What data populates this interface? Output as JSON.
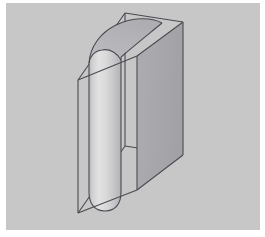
{
  "figure": {
    "canvas": {
      "width": 265,
      "height": 237
    },
    "colors": {
      "page_background": "#ffffff",
      "plot_background": "#c8c8c8",
      "edge_line": "#4a4a52",
      "box_right_face": "#a8a8ac",
      "box_front_face": "#c2c2c4",
      "cylinder_light": "#dcdcdc",
      "cylinder_mid": "#c9c9cb",
      "cylinder_dark": "#b4b4b8",
      "cylinder_top_cut": "#b9b9bd"
    },
    "background_rect": {
      "x": 6,
      "y": 3,
      "width": 254,
      "height": 227
    },
    "line_width": 1.1,
    "box_vertices": {
      "front_top_left": {
        "x": 78,
        "y": 80
      },
      "front_bottom_left": {
        "x": 78,
        "y": 213
      },
      "front_top_right": {
        "x": 137,
        "y": 56
      },
      "front_bottom_right": {
        "x": 137,
        "y": 190
      },
      "back_top_left": {
        "x": 125,
        "y": 13
      },
      "back_bottom_left": {
        "x": 125,
        "y": 146
      },
      "back_top_right": {
        "x": 183,
        "y": 22
      },
      "back_bottom_right": {
        "x": 183,
        "y": 155
      }
    },
    "cylinder": {
      "axis_top": {
        "x": 105,
        "y": 58
      },
      "axis_bottom": {
        "x": 105,
        "y": 205
      },
      "radius_x": 28,
      "radius_y": 11,
      "silhouette_left_x": 89,
      "silhouette_right_x": 131,
      "cut_angle_note": "top face is an oblique elliptical cut sloping up toward the back-right"
    },
    "faces": [
      {
        "name": "box-right-face",
        "shade": "#a8a8ac"
      },
      {
        "name": "box-front-face",
        "shade": "#c2c2c4"
      },
      {
        "name": "cylinder-body",
        "shade": "gradient"
      },
      {
        "name": "cylinder-top-cut",
        "shade": "#b9b9bd"
      }
    ]
  }
}
